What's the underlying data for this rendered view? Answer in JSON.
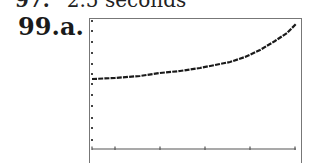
{
  "previous_answer": {
    "number": "97.",
    "text": "2.5 seconds"
  },
  "problem": {
    "number": "99.",
    "part": "a."
  },
  "chart_data": {
    "type": "line",
    "title": "",
    "xlabel": "",
    "ylabel": "",
    "grid": false,
    "legend": "none",
    "x_ticks_count": 5,
    "y_ticks_count": 12,
    "x_tick_px": [
      92,
      115,
      160,
      205,
      250,
      295
    ],
    "y_tick_px": [
      21,
      31,
      42,
      53,
      64,
      74,
      84,
      95,
      106,
      118,
      128,
      140
    ],
    "series": [
      {
        "name": "curve",
        "points_px": [
          [
            92,
            79
          ],
          [
            115,
            78
          ],
          [
            140,
            76
          ],
          [
            160,
            73
          ],
          [
            180,
            71
          ],
          [
            200,
            68
          ],
          [
            215,
            65
          ],
          [
            230,
            62
          ],
          [
            245,
            57
          ],
          [
            260,
            50
          ],
          [
            275,
            41
          ],
          [
            287,
            33
          ],
          [
            296,
            24
          ]
        ]
      }
    ],
    "axes": {
      "origin_px": [
        92,
        149
      ],
      "x_axis_end_px": 296,
      "y_axis_top_px": 20
    },
    "colors": {
      "curve": "#1a1a1a",
      "axes": "#555555",
      "frame": "#777777"
    }
  }
}
